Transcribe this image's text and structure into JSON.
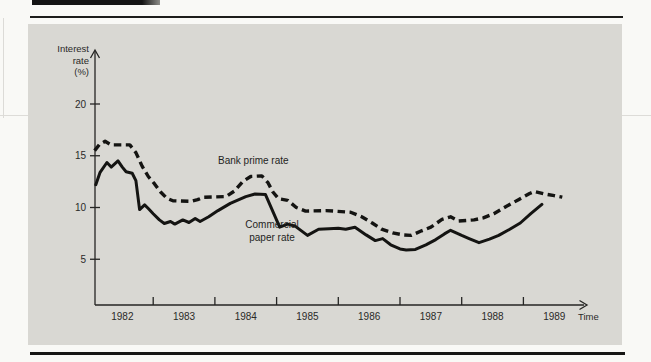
{
  "page": {
    "kind": "scanned textbook figure",
    "background_color": "#d9d8d3",
    "line_color": "#141412"
  },
  "chart_data": {
    "type": "line",
    "title": "",
    "ylabel_lines": [
      "Interest",
      "rate",
      "(%)"
    ],
    "xlabel": "Time",
    "y_ticks": [
      5,
      10,
      15,
      20
    ],
    "ylim": [
      0,
      22
    ],
    "x_years": [
      1982,
      1983,
      1984,
      1985,
      1986,
      1987,
      1988,
      1989
    ],
    "x_range": [
      1982,
      1989.9
    ],
    "grid": "off",
    "legend_position": "labels-on-chart",
    "line_color": "#141412",
    "series": [
      {
        "name": "Bank prime rate",
        "style": "dashed",
        "points": [
          [
            1982.05,
            15.5
          ],
          [
            1982.13,
            16.1
          ],
          [
            1982.22,
            16.4
          ],
          [
            1982.32,
            16.05
          ],
          [
            1982.62,
            16.05
          ],
          [
            1982.72,
            15.3
          ],
          [
            1982.82,
            14.0
          ],
          [
            1982.92,
            13.0
          ],
          [
            1983.02,
            12.3
          ],
          [
            1983.12,
            11.5
          ],
          [
            1983.22,
            10.9
          ],
          [
            1983.32,
            10.65
          ],
          [
            1983.62,
            10.6
          ],
          [
            1983.72,
            10.75
          ],
          [
            1983.82,
            11.0
          ],
          [
            1984.18,
            11.05
          ],
          [
            1984.32,
            11.6
          ],
          [
            1984.45,
            12.5
          ],
          [
            1984.58,
            13.0
          ],
          [
            1984.76,
            13.05
          ],
          [
            1984.86,
            12.4
          ],
          [
            1984.94,
            11.5
          ],
          [
            1985.03,
            10.85
          ],
          [
            1985.18,
            10.7
          ],
          [
            1985.32,
            10.0
          ],
          [
            1985.47,
            9.65
          ],
          [
            1985.8,
            9.7
          ],
          [
            1986.2,
            9.55
          ],
          [
            1986.38,
            9.1
          ],
          [
            1986.55,
            8.5
          ],
          [
            1986.7,
            7.9
          ],
          [
            1986.88,
            7.55
          ],
          [
            1987.05,
            7.35
          ],
          [
            1987.18,
            7.3
          ],
          [
            1987.35,
            7.75
          ],
          [
            1987.5,
            8.1
          ],
          [
            1987.68,
            8.85
          ],
          [
            1987.82,
            9.1
          ],
          [
            1987.95,
            8.7
          ],
          [
            1988.2,
            8.8
          ],
          [
            1988.35,
            9.0
          ],
          [
            1988.52,
            9.4
          ],
          [
            1988.72,
            10.1
          ],
          [
            1988.92,
            10.75
          ],
          [
            1989.1,
            11.35
          ],
          [
            1989.18,
            11.55
          ],
          [
            1989.35,
            11.3
          ],
          [
            1989.5,
            11.15
          ],
          [
            1989.63,
            11.0
          ]
        ]
      },
      {
        "name": "Commercial paper rate",
        "style": "solid",
        "points": [
          [
            1982.07,
            12.2
          ],
          [
            1982.14,
            13.4
          ],
          [
            1982.25,
            14.35
          ],
          [
            1982.32,
            13.9
          ],
          [
            1982.43,
            14.5
          ],
          [
            1982.5,
            13.9
          ],
          [
            1982.56,
            13.45
          ],
          [
            1982.66,
            13.3
          ],
          [
            1982.72,
            12.6
          ],
          [
            1982.78,
            9.8
          ],
          [
            1982.86,
            10.25
          ],
          [
            1982.92,
            9.9
          ],
          [
            1983.0,
            9.4
          ],
          [
            1983.1,
            8.8
          ],
          [
            1983.18,
            8.45
          ],
          [
            1983.28,
            8.65
          ],
          [
            1983.35,
            8.4
          ],
          [
            1983.48,
            8.8
          ],
          [
            1983.58,
            8.55
          ],
          [
            1983.68,
            8.95
          ],
          [
            1983.76,
            8.65
          ],
          [
            1983.9,
            9.1
          ],
          [
            1984.05,
            9.7
          ],
          [
            1984.25,
            10.4
          ],
          [
            1984.5,
            11.05
          ],
          [
            1984.65,
            11.3
          ],
          [
            1984.82,
            11.25
          ],
          [
            1985.05,
            8.1
          ],
          [
            1985.18,
            8.4
          ],
          [
            1985.3,
            8.2
          ],
          [
            1985.5,
            7.3
          ],
          [
            1985.68,
            7.9
          ],
          [
            1985.85,
            7.95
          ],
          [
            1986.0,
            8.0
          ],
          [
            1986.12,
            7.9
          ],
          [
            1986.27,
            8.1
          ],
          [
            1986.45,
            7.35
          ],
          [
            1986.6,
            6.8
          ],
          [
            1986.72,
            7.0
          ],
          [
            1986.85,
            6.4
          ],
          [
            1987.0,
            6.0
          ],
          [
            1987.1,
            5.9
          ],
          [
            1987.25,
            5.95
          ],
          [
            1987.42,
            6.4
          ],
          [
            1987.58,
            6.9
          ],
          [
            1987.72,
            7.45
          ],
          [
            1987.82,
            7.8
          ],
          [
            1988.0,
            7.3
          ],
          [
            1988.12,
            7.0
          ],
          [
            1988.28,
            6.6
          ],
          [
            1988.45,
            6.95
          ],
          [
            1988.6,
            7.3
          ],
          [
            1988.78,
            7.9
          ],
          [
            1988.95,
            8.5
          ],
          [
            1989.12,
            9.4
          ],
          [
            1989.3,
            10.3
          ]
        ]
      }
    ],
    "labels": {
      "prime": "Bank prime rate",
      "cp_line1": "Commercial",
      "cp_line2": "paper rate"
    }
  }
}
